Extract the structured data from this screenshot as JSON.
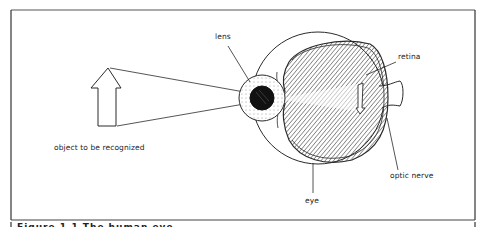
{
  "figure": {
    "labels": {
      "lens": "lens",
      "retina": "retina",
      "object": "object to be recognized",
      "eye": "eye",
      "optic_nerve": "optic nerve"
    },
    "caption_partial": "Figure 1.1  The human eye"
  },
  "colors": {
    "line": "#2a2a2a",
    "background": "#ffffff",
    "pupil": "#111111"
  }
}
